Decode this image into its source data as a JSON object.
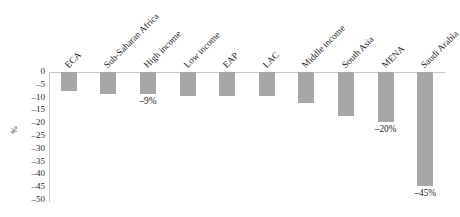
{
  "chart_data": {
    "type": "bar",
    "title": "",
    "subtitle": "",
    "xlabel": "",
    "ylabel": "%",
    "ylim": [
      -50,
      0
    ],
    "ytick_labels": [
      "0",
      "–5",
      "–10",
      "–15",
      "–20",
      "–25",
      "–30",
      "–35",
      "–40",
      "–45",
      "–50"
    ],
    "ytick_values": [
      0,
      -5,
      -10,
      -15,
      -20,
      -25,
      -30,
      -35,
      -40,
      -45,
      -50
    ],
    "grid": false,
    "legend": null,
    "bar_color": "#a7a7a7",
    "axis_color": "#c9c9c9",
    "categories": [
      "ECA",
      "Sub-Saharan Africa",
      "High income",
      "Low income",
      "EAP",
      "LAC",
      "Middle income",
      "South Asia",
      "MENA",
      "Saudi Arabia"
    ],
    "values": [
      -7.5,
      -8.5,
      -8.7,
      -9.5,
      -9.5,
      -9.3,
      -12.0,
      -17.0,
      -19.5,
      -44.5
    ],
    "data_labels": [
      {
        "category": "High income",
        "text": "–9%",
        "value": -9
      },
      {
        "category": "MENA",
        "text": "–20%",
        "value": -20
      },
      {
        "category": "Saudi Arabia",
        "text": "–45%",
        "value": -45
      }
    ]
  }
}
